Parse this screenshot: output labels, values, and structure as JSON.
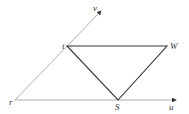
{
  "diagram": {
    "axes": {
      "u_label": "u",
      "v_label": "v"
    },
    "points": {
      "r": "r",
      "t": "t",
      "s": "S",
      "w": "W"
    },
    "colors": {
      "axis": "#9a9a9a",
      "triangle": "#333333",
      "background": "#ffffff"
    }
  }
}
